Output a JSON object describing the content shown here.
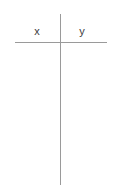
{
  "table": {
    "columns": [
      {
        "key": "x",
        "label": "x"
      },
      {
        "key": "y",
        "label": "y"
      }
    ],
    "rows": [],
    "row_count": 0,
    "colors": {
      "rule": "#9a9a9a",
      "divider": "#9a9a9a",
      "text": "#3c3c3c",
      "background": "#ffffff"
    }
  }
}
